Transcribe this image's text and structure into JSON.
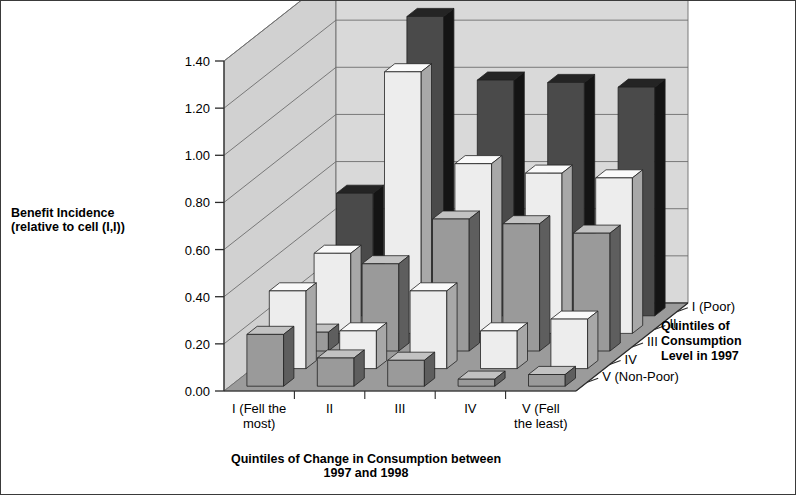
{
  "chart_data": {
    "type": "bar",
    "render": "3d-grouped-bars",
    "title": "",
    "ylabel_line1": "Benefit Incidence",
    "ylabel_line2": "(relative to cell (I,I))",
    "xlabel_line1": "Quintiles of Change in Consumption between",
    "xlabel_line2": "1997 and 1998",
    "zlabel_line1": "Quintiles of",
    "zlabel_line2": "Consumption",
    "zlabel_line3": "Level in 1997",
    "ylim": [
      0.0,
      1.4
    ],
    "ytick_labels": [
      "0.00",
      "0.20",
      "0.40",
      "0.60",
      "0.80",
      "1.00",
      "1.20",
      "1.40"
    ],
    "ytick_values": [
      0.0,
      0.2,
      0.4,
      0.6,
      0.8,
      1.0,
      1.2,
      1.4
    ],
    "grid": true,
    "legend": "none",
    "categories": [
      "I (Fell the most)",
      "II",
      "III",
      "IV",
      "V (Fell the least)"
    ],
    "category_labels": [
      [
        "I (Fell the",
        "most)"
      ],
      [
        "II",
        ""
      ],
      [
        "III",
        ""
      ],
      [
        "IV",
        ""
      ],
      [
        "V (Fell",
        "the least)"
      ]
    ],
    "depth_categories": [
      "I (Poor)",
      "II",
      "III",
      "IV",
      "V (Non-Poor)"
    ],
    "series": [
      {
        "name": "I (Poor)",
        "values": [
          0.52,
          1.27,
          1.0,
          0.99,
          0.97
        ]
      },
      {
        "name": "II",
        "values": [
          0.34,
          1.11,
          0.72,
          0.68,
          0.66
        ]
      },
      {
        "name": "III",
        "values": [
          0.08,
          0.37,
          0.56,
          0.54,
          0.5
        ]
      },
      {
        "name": "IV",
        "values": [
          0.33,
          0.16,
          0.33,
          0.16,
          0.21
        ]
      },
      {
        "name": "V (Non-Poor)",
        "values": [
          0.22,
          0.12,
          0.11,
          0.03,
          0.05
        ]
      }
    ],
    "colors": {
      "wall": "#d9d9d9",
      "wall_side": "#d1d1d1",
      "floor": "#9b9b9b",
      "gridline": "#6e6e6e",
      "axis": "#2b2b2b",
      "border": "#3a3a3a",
      "bar_dark_front": "#4a4a4a",
      "bar_dark_side": "#141414",
      "bar_dark_top": "#242424",
      "bar_mid_front": "#9a9a9a",
      "bar_mid_side": "#5e5e5e",
      "bar_mid_top": "#c2c2c2",
      "bar_light_front": "#ededed",
      "bar_light_side": "#a8a8a8",
      "bar_light_top": "#fafafa"
    },
    "series_shade": [
      "dark",
      "light",
      "mid",
      "light",
      "mid"
    ]
  }
}
